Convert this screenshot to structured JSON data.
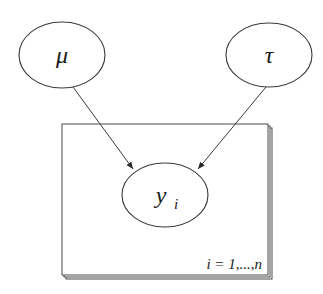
{
  "diagram": {
    "type": "plate-notation",
    "nodes": [
      {
        "id": "mu",
        "label": "μ"
      },
      {
        "id": "tau",
        "label": "τ"
      },
      {
        "id": "y",
        "label": "y",
        "subscript": "i"
      }
    ],
    "edges": [
      {
        "from": "mu",
        "to": "y"
      },
      {
        "from": "tau",
        "to": "y"
      }
    ],
    "plate": {
      "label": "i = 1,...,n",
      "contains": [
        "y"
      ]
    }
  }
}
